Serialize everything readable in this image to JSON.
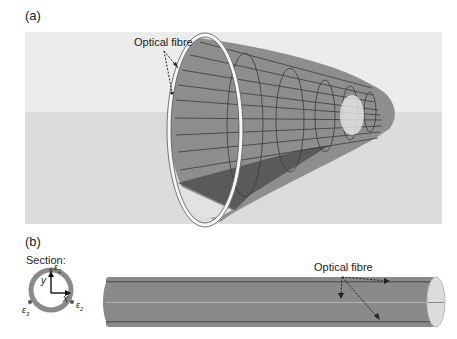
{
  "panel_a": {
    "label": "(a)",
    "annotation": "Optical fibre",
    "colors": {
      "sky": "#ececec",
      "ground": "#dcdcdc",
      "tube_inner": "#8e8e8e",
      "tube_dark": "#5a5a5a",
      "ring": "#f4f4f4"
    }
  },
  "panel_b": {
    "label": "(b)",
    "section_label": "Section:",
    "axis_y": "y",
    "axis_x": "x",
    "sensor_1": "ε",
    "sensor_1_sub": "1",
    "sensor_2": "ε",
    "sensor_2_sub": "2",
    "sensor_3": "ε",
    "sensor_3_sub": "3",
    "annotation": "Optical fibre",
    "colors": {
      "pipe": "#8a8a8a",
      "pipe_dark": "#5c5c5c",
      "ring": "#888888"
    }
  }
}
